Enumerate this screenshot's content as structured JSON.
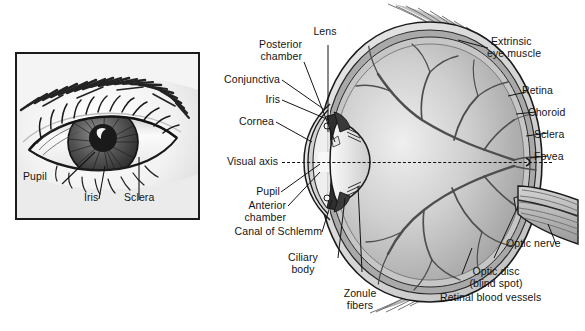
{
  "figure": {
    "type": "anatomical-diagram",
    "panels": [
      "external-eye-photo-panel",
      "eye-cross-section"
    ]
  },
  "external_panel": {
    "name": "external eye illustration",
    "labels": [
      {
        "id": "pupil",
        "text": "Pupil"
      },
      {
        "id": "iris",
        "text": "Iris"
      },
      {
        "id": "sclera",
        "text": "Sclera"
      }
    ]
  },
  "cross_section": {
    "name": "sagittal section of the eyeball",
    "visual_axis_label": "Visual axis",
    "left_labels": [
      {
        "id": "lens",
        "text": "Lens"
      },
      {
        "id": "posterior-chamber",
        "line1": "Posterior",
        "line2": "chamber"
      },
      {
        "id": "conjunctiva",
        "text": "Conjunctiva"
      },
      {
        "id": "iris",
        "text": "Iris"
      },
      {
        "id": "cornea",
        "text": "Cornea"
      },
      {
        "id": "pupil",
        "text": "Pupil"
      },
      {
        "id": "anterior-chamber",
        "line1": "Anterior",
        "line2": "chamber"
      },
      {
        "id": "canal-of-schlemm",
        "text": "Canal of Schlemm"
      },
      {
        "id": "ciliary-body",
        "line1": "Ciliary",
        "line2": "body"
      },
      {
        "id": "zonule-fibers",
        "line1": "Zonule",
        "line2": "fibers"
      }
    ],
    "right_labels": [
      {
        "id": "extrinsic-eye-muscle",
        "line1": "Extrinsic",
        "line2": "eye muscle"
      },
      {
        "id": "retina",
        "text": "Retina"
      },
      {
        "id": "choroid",
        "text": "Choroid"
      },
      {
        "id": "sclera",
        "text": "Sclera"
      },
      {
        "id": "fovea",
        "text": "Fovea"
      },
      {
        "id": "optic-nerve",
        "text": "Optic nerve"
      },
      {
        "id": "optic-disc",
        "line1": "Optic disc",
        "line2": "(blind spot)"
      },
      {
        "id": "retinal-blood-vessels",
        "text": "Retinal blood vessels"
      }
    ]
  },
  "caption": {
    "text": ""
  },
  "colors": {
    "ink": "#141414",
    "outline": "#1b1b1b",
    "sclera_layer": "#d9d9d9",
    "choroid_layer": "#a8a8a8",
    "retina_layer": "#c4c4c4",
    "vitreous": "#b9b9b9",
    "vitreous_light": "#e2e2e2",
    "lens": "#ededed",
    "iris_dark": "#3a3a3a",
    "vessel": "#4a4a4a",
    "background": "#ffffff"
  }
}
